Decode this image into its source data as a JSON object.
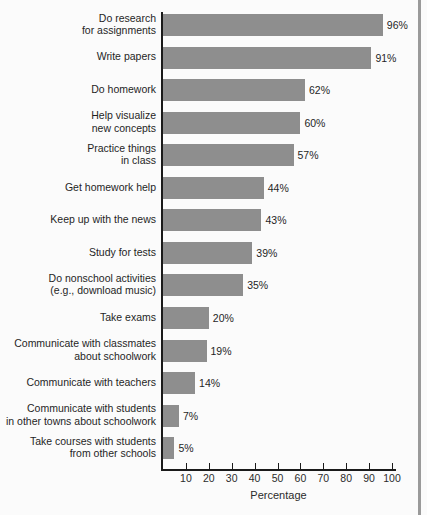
{
  "chart_data": {
    "type": "bar",
    "orientation": "horizontal",
    "title": "",
    "xlabel": "Percentage",
    "ylabel": "",
    "xlim": [
      0,
      108
    ],
    "grid": false,
    "legend": null,
    "bar_color": "#8e8e8e",
    "axis_color": "#1a1a1a",
    "background_color": "#fbfbfb",
    "xticks": [
      10,
      20,
      30,
      40,
      50,
      60,
      70,
      80,
      90,
      100
    ],
    "xtick_labels": [
      "10",
      "20",
      "30",
      "40",
      "50",
      "60",
      "70",
      "80",
      "90",
      "100"
    ],
    "categories": [
      "Do research\nfor assignments",
      "Write papers",
      "Do homework",
      "Help visualize\nnew concepts",
      "Practice things\nin class",
      "Get homework help",
      "Keep up with the news",
      "Study for tests",
      "Do nonschool activities\n(e.g., download music)",
      "Take exams",
      "Communicate with classmates\nabout schoolwork",
      "Communicate with teachers",
      "Communicate with students\nin other towns about schoolwork",
      "Take courses with students\nfrom other schools"
    ],
    "values": [
      96,
      91,
      62,
      60,
      57,
      44,
      43,
      39,
      35,
      20,
      19,
      14,
      7,
      5
    ],
    "value_labels": [
      "96%",
      "91%",
      "62%",
      "60%",
      "57%",
      "44%",
      "43%",
      "39%",
      "35%",
      "20%",
      "19%",
      "14%",
      "7%",
      "5%"
    ]
  }
}
